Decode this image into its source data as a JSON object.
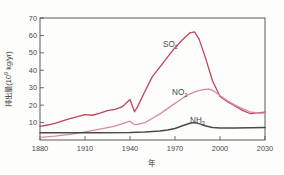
{
  "figure": {
    "background_color": "#fdfdfb",
    "axis_color": "#4b4b4b",
    "text_color": "#3a3a3a"
  },
  "axes": {
    "y_title_main": "排出量",
    "y_title_unit_open": "(10",
    "y_title_unit_exp": "9",
    "y_title_unit_close": " kg/yr)",
    "x_title": "年",
    "y_ticks": [
      "10",
      "20",
      "30",
      "40",
      "50",
      "60",
      "70"
    ],
    "x_ticks": [
      "1880",
      "1910",
      "1940",
      "1970",
      "2000",
      "2030"
    ]
  },
  "series_labels": {
    "so2_base": "SO",
    "so2_sub": "2",
    "no2_base": "NO",
    "no2_sub": "2",
    "nh3_base": "NH",
    "nh3_sub": "3"
  },
  "chart_data": {
    "type": "line",
    "title": "",
    "xlabel": "年",
    "ylabel": "排出量 (10⁹ kg/yr)",
    "xlim": [
      1880,
      2030
    ],
    "ylim": [
      0,
      70
    ],
    "y_ticks": [
      10,
      20,
      30,
      40,
      50,
      60,
      70
    ],
    "x_ticks": [
      1880,
      1910,
      1940,
      1970,
      2000,
      2030
    ],
    "grid": false,
    "legend": "inline-annotations",
    "colors": {
      "SO2": "#c2445c",
      "NO2": "#d98c9e",
      "NH3": "#4a4a4a"
    },
    "series": [
      {
        "name": "SO2",
        "color": "#c2445c",
        "x": [
          1880,
          1885,
          1890,
          1895,
          1900,
          1905,
          1910,
          1915,
          1920,
          1925,
          1930,
          1935,
          1940,
          1943,
          1945,
          1950,
          1955,
          1960,
          1965,
          1970,
          1975,
          1980,
          1983,
          1986,
          1990,
          1995,
          2000,
          2005,
          2010,
          2015,
          2020,
          2025,
          2030
        ],
        "y": [
          7.8,
          8.6,
          9.6,
          11.0,
          12.2,
          13.4,
          14.6,
          14.2,
          15.4,
          16.8,
          17.6,
          19.2,
          23.2,
          16.2,
          19.0,
          28.0,
          36.5,
          42.0,
          47.5,
          53.0,
          57.5,
          61.5,
          62.0,
          58.0,
          48.0,
          34.0,
          25.0,
          22.0,
          19.5,
          17.0,
          15.2,
          15.6,
          16.0
        ]
      },
      {
        "name": "NO2",
        "color": "#d98c9e",
        "x": [
          1880,
          1890,
          1900,
          1910,
          1920,
          1930,
          1940,
          1943,
          1945,
          1950,
          1955,
          1960,
          1965,
          1970,
          1975,
          1980,
          1985,
          1990,
          1993,
          1996,
          2000,
          2005,
          2010,
          2015,
          2020,
          2025,
          2030
        ],
        "y": [
          1.5,
          2.2,
          3.2,
          4.6,
          6.2,
          8.0,
          10.8,
          8.8,
          9.0,
          10.0,
          12.5,
          15.0,
          18.0,
          21.0,
          24.0,
          26.5,
          28.2,
          29.0,
          29.2,
          28.0,
          25.5,
          22.5,
          20.0,
          18.0,
          16.2,
          15.5,
          15.4
        ]
      },
      {
        "name": "NH3",
        "color": "#4a4a4a",
        "x": [
          1880,
          1900,
          1920,
          1940,
          1950,
          1960,
          1965,
          1970,
          1975,
          1980,
          1983,
          1986,
          1990,
          1995,
          2000,
          2010,
          2020,
          2030
        ],
        "y": [
          4.1,
          4.1,
          4.2,
          4.3,
          4.6,
          5.2,
          5.8,
          6.6,
          8.2,
          9.6,
          10.0,
          9.4,
          8.2,
          7.2,
          6.9,
          6.9,
          7.0,
          7.2
        ]
      }
    ],
    "annotations": [
      {
        "text": "SO2",
        "x": 1966,
        "y": 55
      },
      {
        "text": "NO2",
        "x": 1972,
        "y": 29.5
      },
      {
        "text": "NH3",
        "x": 1982,
        "y": 13
      }
    ]
  }
}
